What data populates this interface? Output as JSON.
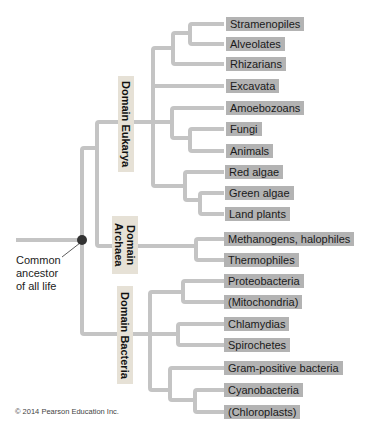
{
  "diagram": {
    "colors": {
      "branch": "#c4c4c4",
      "leaf_box": "#b3b3b3",
      "domain_box": "#e6e1d6",
      "ancestor_node": "#333333"
    },
    "root": {
      "label": "Common ancestor of all life",
      "label_lines": [
        "Common",
        "ancestor",
        "of all life"
      ]
    },
    "domains": [
      {
        "name": "Domain Eukarya",
        "lines": [
          "Domain Eukarya"
        ],
        "leaves": [
          "Stramenopiles",
          "Alveolates",
          "Rhizarians",
          "Excavata",
          "Amoebozoans",
          "Fungi",
          "Animals",
          "Red algae",
          "Green algae",
          "Land plants"
        ]
      },
      {
        "name": "Domain Archaea",
        "lines": [
          "Domain",
          "Archaea"
        ],
        "leaves": [
          "Methanogens, halophiles",
          "Thermophiles"
        ]
      },
      {
        "name": "Domain Bacteria",
        "lines": [
          "Domain Bacteria"
        ],
        "leaves": [
          "Proteobacteria",
          "(Mitochondria)",
          "Chlamydias",
          "Spirochetes",
          "Gram-positive bacteria",
          "Cyanobacteria",
          "(Chloroplasts)"
        ]
      }
    ],
    "copyright": "© 2014 Pearson Education Inc."
  }
}
